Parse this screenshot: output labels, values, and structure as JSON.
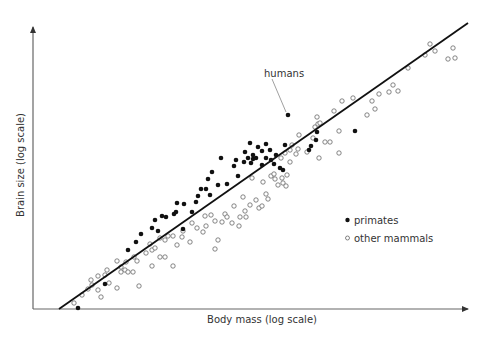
{
  "chart_data": {
    "type": "scatter",
    "title": "",
    "xlabel": "Body mass (log scale)",
    "ylabel": "Brain size (log scale)",
    "grid": false,
    "legend_position": "right-middle",
    "axes": {
      "x_scale": "log",
      "y_scale": "log",
      "ticks": false
    },
    "annotations": [
      {
        "text": "humans",
        "points_to": "highest primate outlier above line"
      }
    ],
    "legend": [
      {
        "label": "primates",
        "marker": "filled-circle"
      },
      {
        "label": "other mammals",
        "marker": "open-circle"
      }
    ],
    "fit_line": {
      "type": "linear (log-log)",
      "from_px": [
        59,
        309
      ],
      "to_px": [
        468,
        23
      ]
    },
    "series": [
      {
        "name": "primates",
        "marker": "filled",
        "points_px": [
          [
            78,
            308
          ],
          [
            105,
            284
          ],
          [
            128,
            250
          ],
          [
            136,
            242
          ],
          [
            141,
            234
          ],
          [
            152,
            228
          ],
          [
            155,
            220
          ],
          [
            162,
            216
          ],
          [
            166,
            217
          ],
          [
            158,
            231
          ],
          [
            174,
            214
          ],
          [
            176,
            212
          ],
          [
            177,
            203
          ],
          [
            184,
            204
          ],
          [
            192,
            212
          ],
          [
            183,
            229
          ],
          [
            196,
            202
          ],
          [
            198,
            196
          ],
          [
            201,
            189
          ],
          [
            206,
            189
          ],
          [
            210,
            195
          ],
          [
            208,
            179
          ],
          [
            212,
            172
          ],
          [
            218,
            185
          ],
          [
            221,
            158
          ],
          [
            227,
            184
          ],
          [
            234,
            166
          ],
          [
            236,
            160
          ],
          [
            238,
            176
          ],
          [
            244,
            162
          ],
          [
            245,
            152
          ],
          [
            248,
            158
          ],
          [
            250,
            143
          ],
          [
            251,
            163
          ],
          [
            253,
            159
          ],
          [
            253,
            155
          ],
          [
            256,
            158
          ],
          [
            258,
            147
          ],
          [
            262,
            151
          ],
          [
            262,
            165
          ],
          [
            266,
            158
          ],
          [
            266,
            144
          ],
          [
            270,
            150
          ],
          [
            271,
            160
          ],
          [
            274,
            164
          ],
          [
            276,
            155
          ],
          [
            280,
            168
          ],
          [
            283,
            170
          ],
          [
            288,
            115
          ],
          [
            285,
            145
          ],
          [
            311,
            146
          ],
          [
            316,
            140
          ],
          [
            317,
            132
          ],
          [
            309,
            150
          ],
          [
            355,
            131
          ]
        ]
      },
      {
        "name": "other mammals",
        "marker": "open",
        "points_px": [
          [
            74,
            303
          ],
          [
            82,
            295
          ],
          [
            88,
            289
          ],
          [
            92,
            285
          ],
          [
            91,
            280
          ],
          [
            98,
            276
          ],
          [
            98,
            290
          ],
          [
            105,
            275
          ],
          [
            107,
            270
          ],
          [
            101,
            297
          ],
          [
            109,
            283
          ],
          [
            117,
            288
          ],
          [
            117,
            261
          ],
          [
            121,
            267
          ],
          [
            121,
            272
          ],
          [
            125,
            270
          ],
          [
            128,
            272
          ],
          [
            126,
            262
          ],
          [
            133,
            272
          ],
          [
            134,
            257
          ],
          [
            137,
            261
          ],
          [
            139,
            286
          ],
          [
            146,
            253
          ],
          [
            150,
            244
          ],
          [
            152,
            250
          ],
          [
            152,
            266
          ],
          [
            155,
            248
          ],
          [
            160,
            257
          ],
          [
            165,
            257
          ],
          [
            160,
            238
          ],
          [
            165,
            240
          ],
          [
            168,
            236
          ],
          [
            173,
            266
          ],
          [
            173,
            236
          ],
          [
            177,
            245
          ],
          [
            182,
            237
          ],
          [
            183,
            231
          ],
          [
            190,
            242
          ],
          [
            192,
            223
          ],
          [
            197,
            228
          ],
          [
            203,
            232
          ],
          [
            205,
            216
          ],
          [
            206,
            226
          ],
          [
            211,
            215
          ],
          [
            215,
            221
          ],
          [
            218,
            240
          ],
          [
            215,
            249
          ],
          [
            222,
            222
          ],
          [
            225,
            214
          ],
          [
            227,
            217
          ],
          [
            232,
            223
          ],
          [
            234,
            206
          ],
          [
            239,
            226
          ],
          [
            240,
            217
          ],
          [
            243,
            197
          ],
          [
            245,
            211
          ],
          [
            246,
            217
          ],
          [
            250,
            205
          ],
          [
            252,
            178
          ],
          [
            256,
            200
          ],
          [
            259,
            208
          ],
          [
            262,
            206
          ],
          [
            263,
            182
          ],
          [
            266,
            194
          ],
          [
            268,
            199
          ],
          [
            271,
            176
          ],
          [
            274,
            174
          ],
          [
            275,
            179
          ],
          [
            278,
            185
          ],
          [
            282,
            178
          ],
          [
            283,
            183
          ],
          [
            286,
            186
          ],
          [
            287,
            175
          ],
          [
            285,
            153
          ],
          [
            281,
            158
          ],
          [
            290,
            162
          ],
          [
            290,
            150
          ],
          [
            292,
            145
          ],
          [
            296,
            154
          ],
          [
            298,
            149
          ],
          [
            299,
            135
          ],
          [
            307,
            152
          ],
          [
            313,
            138
          ],
          [
            315,
            127
          ],
          [
            318,
            124
          ],
          [
            317,
            117
          ],
          [
            320,
            123
          ],
          [
            319,
            158
          ],
          [
            325,
            142
          ],
          [
            330,
            142
          ],
          [
            334,
            111
          ],
          [
            339,
            131
          ],
          [
            342,
            101
          ],
          [
            339,
            153
          ],
          [
            353,
            98
          ],
          [
            367,
            115
          ],
          [
            372,
            101
          ],
          [
            375,
            109
          ],
          [
            379,
            94
          ],
          [
            389,
            92
          ],
          [
            393,
            85
          ],
          [
            398,
            91
          ],
          [
            408,
            68
          ],
          [
            425,
            55
          ],
          [
            435,
            51
          ],
          [
            430,
            44
          ],
          [
            448,
            59
          ],
          [
            455,
            58
          ],
          [
            453,
            48
          ]
        ]
      }
    ]
  },
  "labels": {
    "xlabel": "Body mass (log scale)",
    "ylabel": "Brain size (log scale)",
    "annotation_humans": "humans",
    "legend_primates": "primates",
    "legend_other": "other mammals"
  },
  "colors": {
    "axis": "#555555",
    "line": "#111111",
    "filled": "#111111",
    "open_stroke": "#666666",
    "text": "#333333"
  }
}
